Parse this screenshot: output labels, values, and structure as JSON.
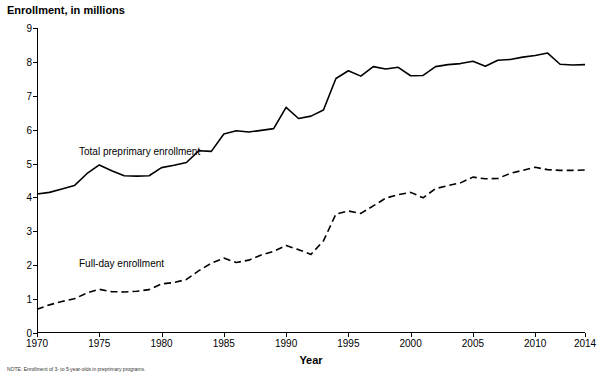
{
  "chart_data": {
    "type": "line",
    "title": "Enrollment, in millions",
    "xlabel": "Year",
    "ylabel": "",
    "xlim": [
      1970,
      2014
    ],
    "ylim": [
      0,
      9
    ],
    "yticks": [
      "0",
      "1",
      "2",
      "3",
      "4",
      "5",
      "6",
      "7",
      "8",
      "9"
    ],
    "xticks": [
      "1970",
      "1975",
      "1980",
      "1985",
      "1990",
      "1995",
      "2000",
      "2005",
      "2010",
      "2014"
    ],
    "grid": false,
    "legend_position": "inline-annotations",
    "x": [
      1970,
      1971,
      1972,
      1973,
      1974,
      1975,
      1976,
      1977,
      1978,
      1979,
      1980,
      1981,
      1982,
      1983,
      1984,
      1985,
      1986,
      1987,
      1988,
      1989,
      1990,
      1991,
      1992,
      1993,
      1994,
      1995,
      1996,
      1997,
      1998,
      1999,
      2000,
      2001,
      2002,
      2003,
      2004,
      2005,
      2006,
      2007,
      2008,
      2009,
      2010,
      2011,
      2012,
      2013,
      2014
    ],
    "series": [
      {
        "name": "Total preprimary enrollment",
        "style": "solid",
        "values": [
          4.1,
          4.15,
          4.25,
          4.35,
          4.7,
          4.96,
          4.79,
          4.64,
          4.63,
          4.64,
          4.88,
          4.95,
          5.03,
          5.38,
          5.36,
          5.87,
          5.97,
          5.93,
          5.98,
          6.03,
          6.66,
          6.33,
          6.4,
          6.58,
          7.51,
          7.74,
          7.58,
          7.86,
          7.79,
          7.84,
          7.59,
          7.6,
          7.86,
          7.92,
          7.95,
          8.02,
          7.87,
          8.05,
          8.07,
          8.14,
          8.19,
          8.26,
          7.93,
          7.91,
          7.92
        ]
      },
      {
        "name": "Full-day enrollment",
        "style": "dashed",
        "values": [
          0.7,
          0.83,
          0.93,
          1.01,
          1.18,
          1.29,
          1.22,
          1.21,
          1.23,
          1.28,
          1.45,
          1.49,
          1.58,
          1.84,
          2.06,
          2.21,
          2.08,
          2.15,
          2.3,
          2.41,
          2.58,
          2.46,
          2.32,
          2.72,
          3.51,
          3.6,
          3.53,
          3.75,
          3.98,
          4.08,
          4.15,
          3.99,
          4.26,
          4.35,
          4.43,
          4.6,
          4.55,
          4.56,
          4.71,
          4.8,
          4.89,
          4.82,
          4.8,
          4.8,
          4.81
        ]
      }
    ],
    "annotations": [
      {
        "text": "Total preprimary enrollment",
        "series": "Total preprimary enrollment"
      },
      {
        "text": "Full-day enrollment",
        "series": "Full-day enrollment"
      }
    ]
  },
  "footnote": "NOTE: Enrollment of 3- to 5-year-olds in preprimary programs."
}
